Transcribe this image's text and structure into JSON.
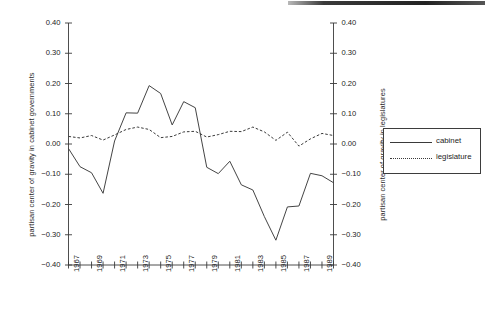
{
  "chart_data": {
    "type": "line",
    "title": "",
    "xlabel": "",
    "ylabel": "partisan center of gravity in cabinet governments",
    "ylabel_right": "partisan center of gravity in legislatures",
    "ylim": [
      -0.4,
      0.4
    ],
    "xlim": [
      1967,
      1990
    ],
    "grid": false,
    "legend_position": "right-outside",
    "y_ticks": [
      "0.40",
      "0.30",
      "0.20",
      "0.10",
      "0.00",
      "-0.10",
      "-0.20",
      "-0.30",
      "-0.40"
    ],
    "y_tick_values": [
      0.4,
      0.3,
      0.2,
      0.1,
      0.0,
      -0.1,
      -0.2,
      -0.3,
      -0.4
    ],
    "y_ticks_right": [
      "0.40",
      "0.30",
      "0.20",
      "0.10",
      "0.00",
      "-0.10",
      "-0.20",
      "-0.30",
      "-0.40"
    ],
    "x_tick_labels": [
      "1967",
      "1969",
      "1971",
      "1973",
      "1975",
      "1977",
      "1979",
      "1981",
      "1983",
      "1985",
      "1987",
      "1989"
    ],
    "x_minor_years": [
      1967,
      1968,
      1969,
      1970,
      1971,
      1972,
      1973,
      1974,
      1975,
      1976,
      1977,
      1978,
      1979,
      1980,
      1981,
      1982,
      1983,
      1984,
      1985,
      1986,
      1987,
      1988,
      1989,
      1990
    ],
    "x": [
      1967,
      1968,
      1969,
      1970,
      1971,
      1972,
      1973,
      1974,
      1975,
      1976,
      1977,
      1978,
      1979,
      1980,
      1981,
      1982,
      1983,
      1984,
      1985,
      1986,
      1987,
      1988,
      1989,
      1990
    ],
    "series": [
      {
        "name": "cabinet",
        "style": "solid",
        "color": "#3a3a3a",
        "values": [
          -0.015,
          -0.075,
          -0.095,
          -0.163,
          0.01,
          0.103,
          0.102,
          0.193,
          0.167,
          0.063,
          0.14,
          0.12,
          -0.077,
          -0.098,
          -0.057,
          -0.135,
          -0.152,
          -0.24,
          -0.318,
          -0.208,
          -0.205,
          -0.097,
          -0.105,
          -0.128
        ]
      },
      {
        "name": "legislature",
        "style": "dotted",
        "color": "#3a3a3a",
        "values": [
          0.025,
          0.02,
          0.028,
          0.013,
          0.03,
          0.048,
          0.056,
          0.048,
          0.021,
          0.025,
          0.04,
          0.042,
          0.023,
          0.031,
          0.042,
          0.041,
          0.056,
          0.04,
          0.012,
          0.039,
          -0.007,
          0.017,
          0.035,
          0.028
        ]
      }
    ]
  },
  "legend": {
    "entries": [
      {
        "label": "cabinet",
        "style": "solid"
      },
      {
        "label": "legislature",
        "style": "dotted"
      }
    ]
  }
}
